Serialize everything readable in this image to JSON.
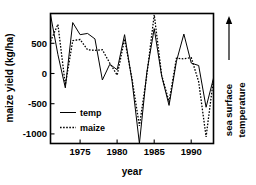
{
  "chart_data": {
    "type": "line",
    "title": "",
    "xlabel": "year",
    "ylabel": "maize yield (kg/ha)",
    "right_axis_label": "sea surface temperature",
    "right_axis_arrow": "up-arrow-icon",
    "xlim": [
      1971,
      1993
    ],
    "ylim": [
      -1300,
      850
    ],
    "grid": false,
    "legend_position": "inside-lower-left",
    "x_ticks": [
      1975,
      1980,
      1985,
      1990
    ],
    "x_tick_labels": [
      "1975",
      "1980",
      "1985",
      "1990"
    ],
    "y_ticks": [
      500,
      0,
      -500,
      -1000
    ],
    "y_tick_labels": [
      "500",
      "0",
      "-500",
      "-1000"
    ],
    "x": [
      1971,
      1972,
      1973,
      1974,
      1975,
      1976,
      1977,
      1978,
      1979,
      1980,
      1981,
      1982,
      1983,
      1984,
      1985,
      1986,
      1987,
      1988,
      1989,
      1990,
      1991,
      1992,
      1993
    ],
    "series": [
      {
        "name": "temp",
        "style": "solid",
        "color": "#000000",
        "values": [
          830,
          170,
          -380,
          700,
          500,
          520,
          430,
          -250,
          10,
          -80,
          500,
          -260,
          -1300,
          -120,
          600,
          -180,
          -670,
          60,
          510,
          30,
          -10,
          -700,
          -220
        ]
      },
      {
        "name": "maize",
        "style": "dotted",
        "color": "#000000",
        "values": [
          390,
          670,
          -330,
          400,
          420,
          250,
          240,
          250,
          30,
          -170,
          430,
          -230,
          -1010,
          -170,
          830,
          -170,
          -610,
          110,
          100,
          120,
          -280,
          -1190,
          -230
        ]
      }
    ]
  },
  "legend": {
    "items": [
      {
        "label": "temp",
        "style": "solid"
      },
      {
        "label": "maize",
        "style": "dotted"
      }
    ]
  },
  "axes": {
    "y_title": "maize yield (kg/ha)",
    "x_title": "year",
    "right_title_line1": "sea surface",
    "right_title_line2": "temperature"
  }
}
